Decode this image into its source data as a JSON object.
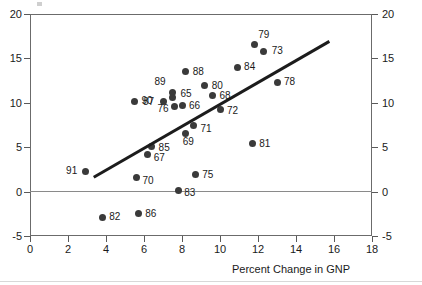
{
  "chart_data": {
    "type": "scatter",
    "title": "",
    "xlabel": "Percent Change in GNP",
    "ylabel": "",
    "xlim": [
      0,
      18
    ],
    "ylim": [
      -5,
      20
    ],
    "xticks": [
      0,
      2,
      4,
      6,
      8,
      10,
      12,
      14,
      16,
      18
    ],
    "yticks": [
      -5,
      0,
      5,
      10,
      15,
      20
    ],
    "xtick_labels": [
      "0",
      "2",
      "4",
      "6",
      "8",
      "10",
      "12",
      "14",
      "16",
      "18"
    ],
    "ytick_labels_left": [
      "20",
      "15",
      "10",
      "5",
      "0",
      "-5"
    ],
    "ytick_labels_right": [
      "20",
      "15",
      "10",
      "5",
      "0",
      "-5"
    ],
    "grid": false,
    "legend": false,
    "point_label_field": "year",
    "points": [
      {
        "year": "79",
        "x": 11.8,
        "y": 16.6,
        "label_dx": 4,
        "label_dy": -10
      },
      {
        "year": "73",
        "x": 12.3,
        "y": 15.8,
        "label_dx": 8,
        "label_dy": -1
      },
      {
        "year": "84",
        "x": 10.9,
        "y": 14.0,
        "label_dx": 7,
        "label_dy": -1
      },
      {
        "year": "88",
        "x": 8.2,
        "y": 13.5,
        "label_dx": 7,
        "label_dy": -1
      },
      {
        "year": "80",
        "x": 9.2,
        "y": 11.9,
        "label_dx": 7,
        "label_dy": -1
      },
      {
        "year": "78",
        "x": 13.0,
        "y": 12.3,
        "label_dx": 7,
        "label_dy": -1
      },
      {
        "year": "89",
        "x": 7.5,
        "y": 11.2,
        "label_dx": -18,
        "label_dy": -11
      },
      {
        "year": "65",
        "x": 7.5,
        "y": 10.6,
        "label_dx": 8,
        "label_dy": -4
      },
      {
        "year": "68",
        "x": 9.6,
        "y": 10.8,
        "label_dx": 7,
        "label_dy": -1
      },
      {
        "year": "87",
        "x": 7.0,
        "y": 10.2,
        "label_dx": -20,
        "label_dy": 0
      },
      {
        "year": "90",
        "x": 5.5,
        "y": 10.2,
        "label_dx": 7,
        "label_dy": -1
      },
      {
        "year": "66",
        "x": 8.0,
        "y": 9.7,
        "label_dx": 7,
        "label_dy": 0
      },
      {
        "year": "76",
        "x": 7.6,
        "y": 9.6,
        "label_dx": -17,
        "label_dy": 2
      },
      {
        "year": "72",
        "x": 10.0,
        "y": 9.2,
        "label_dx": 7,
        "label_dy": 0
      },
      {
        "year": "71",
        "x": 8.6,
        "y": 7.4,
        "label_dx": 7,
        "label_dy": 2
      },
      {
        "year": "69",
        "x": 8.2,
        "y": 6.5,
        "label_dx": -3,
        "label_dy": 7
      },
      {
        "year": "81",
        "x": 11.7,
        "y": 5.4,
        "label_dx": 7,
        "label_dy": -1
      },
      {
        "year": "85",
        "x": 6.4,
        "y": 5.1,
        "label_dx": 7,
        "label_dy": 1
      },
      {
        "year": "67",
        "x": 6.2,
        "y": 4.2,
        "label_dx": 6,
        "label_dy": 3
      },
      {
        "year": "91",
        "x": 2.9,
        "y": 2.3,
        "label_dx": -19,
        "label_dy": -1
      },
      {
        "year": "75",
        "x": 8.7,
        "y": 1.9,
        "label_dx": 7,
        "label_dy": -1
      },
      {
        "year": "70",
        "x": 5.6,
        "y": 1.6,
        "label_dx": 6,
        "label_dy": 3
      },
      {
        "year": "83",
        "x": 7.8,
        "y": 0.1,
        "label_dx": 6,
        "label_dy": 1
      },
      {
        "year": "86",
        "x": 5.7,
        "y": -2.5,
        "label_dx": 7,
        "label_dy": -1
      },
      {
        "year": "82",
        "x": 3.8,
        "y": -2.9,
        "label_dx": 7,
        "label_dy": -1
      }
    ],
    "fit_line": {
      "x0": 3.3,
      "y0": 1.8,
      "x1": 15.7,
      "y1": 17.1
    },
    "reference_line": {
      "y": 0
    }
  }
}
